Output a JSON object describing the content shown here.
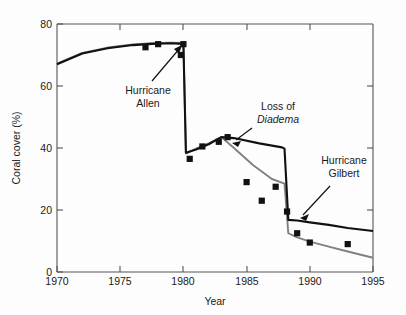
{
  "chart_data": {
    "type": "line",
    "title": "",
    "xlabel": "Year",
    "ylabel": "Coral cover (%)",
    "xlim": [
      1970,
      1995
    ],
    "ylim": [
      0,
      80
    ],
    "xticks": [
      1970,
      1975,
      1980,
      1985,
      1990,
      1995
    ],
    "yticks": [
      0,
      20,
      40,
      60,
      80
    ],
    "xtick_labels": [
      "1970",
      "1975",
      "1980",
      "1985",
      "1990",
      "1995"
    ],
    "ytick_labels": [
      "0",
      "20",
      "40",
      "60",
      "80"
    ],
    "grid": false,
    "legend": "none",
    "series": [
      {
        "name": "model-black",
        "color": "#111111",
        "style": "line",
        "x": [
          1970,
          1972,
          1974,
          1976,
          1977.5,
          1979,
          1980,
          1980.2,
          1981,
          1982,
          1983,
          1984,
          1986,
          1987.8,
          1988,
          1988.3,
          1989,
          1990,
          1991.5,
          1993,
          1995
        ],
        "y": [
          67.0,
          70.5,
          72.2,
          73.2,
          73.6,
          73.8,
          73.6,
          38.5,
          39.5,
          41.2,
          43.5,
          43.2,
          41.5,
          40.2,
          39.8,
          16.8,
          16.6,
          16.0,
          15.2,
          14.2,
          13.2
        ]
      },
      {
        "name": "model-gray",
        "color": "#808080",
        "style": "line",
        "x": [
          1970,
          1972,
          1974,
          1976,
          1977.5,
          1979,
          1980,
          1980.2,
          1981,
          1982,
          1983,
          1984,
          1985.5,
          1987,
          1988,
          1988.3,
          1989,
          1990,
          1991.5,
          1993,
          1995
        ],
        "y": [
          67.2,
          70.7,
          72.4,
          73.4,
          73.8,
          74.0,
          73.9,
          38.2,
          39.8,
          41.5,
          43.5,
          40.0,
          34.5,
          30.0,
          28.5,
          12.5,
          11.2,
          9.8,
          8.2,
          6.6,
          4.6
        ]
      }
    ],
    "points": {
      "name": "observed-cover",
      "marker": "square",
      "color": "#111111",
      "x": [
        1977,
        1978,
        1980,
        1979.8,
        1980.5,
        1981.5,
        1982.8,
        1983.5,
        1985,
        1986.2,
        1987.3,
        1988.2,
        1989,
        1990,
        1993
      ],
      "y": [
        72.5,
        73.5,
        73.5,
        70.0,
        36.5,
        40.5,
        42.0,
        43.5,
        29.0,
        23.0,
        27.5,
        19.5,
        12.5,
        9.5,
        9.0,
        4.5
      ]
    },
    "annotations": [
      {
        "id": "hurricane-allen",
        "line1": "Hurricane",
        "line2": "Allen",
        "target_x": 1980,
        "target_y": 73.0
      },
      {
        "id": "loss-of-diadema",
        "line1": "Loss of",
        "line2": "Diadema",
        "line2_italic": true,
        "target_x": 1983.4,
        "target_y": 43.6
      },
      {
        "id": "hurricane-gilbert",
        "line1": "Hurricane",
        "line2": "Gilbert",
        "target_x": 1988.3,
        "target_y": 18.0
      }
    ]
  }
}
